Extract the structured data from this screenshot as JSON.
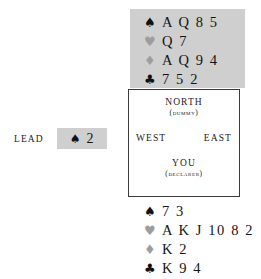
{
  "diagram": {
    "type": "bridge-deal",
    "background_color": "#ffffff",
    "panel_color": "#cfcfcf",
    "border_color": "#3a3a3a",
    "black_suit_color": "#111111",
    "grey_suit_color": "#9d9d9d"
  },
  "lead": {
    "label": "LEAD",
    "suit_symbol": "♠",
    "suit_name": "spade-icon",
    "rank": "2"
  },
  "compass": {
    "north": {
      "name": "NORTH",
      "role": "(DUMMY)"
    },
    "west": {
      "name": "WEST"
    },
    "east": {
      "name": "EAST"
    },
    "south": {
      "name": "YOU",
      "role": "(DECLARER)"
    }
  },
  "hands": {
    "north": {
      "seat": "North",
      "suits": [
        {
          "symbol": "♠",
          "icon": "spade-icon",
          "tone": "black",
          "cards": "A Q 8 5"
        },
        {
          "symbol": "♥",
          "icon": "heart-icon",
          "tone": "grey",
          "cards": "Q 7"
        },
        {
          "symbol": "♦",
          "icon": "diamond-icon",
          "tone": "grey",
          "cards": "A Q 9 4"
        },
        {
          "symbol": "♣",
          "icon": "club-icon",
          "tone": "black",
          "cards": "7 5 2"
        }
      ]
    },
    "south": {
      "seat": "South",
      "suits": [
        {
          "symbol": "♠",
          "icon": "spade-icon",
          "tone": "black",
          "cards": "7 3"
        },
        {
          "symbol": "♥",
          "icon": "heart-icon",
          "tone": "grey",
          "cards": "A K J 10 8 2"
        },
        {
          "symbol": "♦",
          "icon": "diamond-icon",
          "tone": "grey",
          "cards": "K 2"
        },
        {
          "symbol": "♣",
          "icon": "club-icon",
          "tone": "black",
          "cards": "K 9 4"
        }
      ]
    }
  }
}
